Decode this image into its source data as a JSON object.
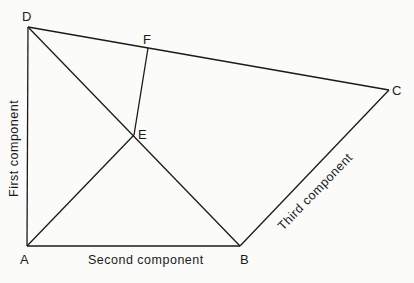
{
  "diagram": {
    "points": {
      "A": {
        "label": "A",
        "x": 27,
        "y": 246
      },
      "B": {
        "label": "B",
        "x": 240,
        "y": 246
      },
      "C": {
        "label": "C",
        "x": 389,
        "y": 90
      },
      "D": {
        "label": "D",
        "x": 28,
        "y": 27
      },
      "E": {
        "label": "E",
        "x": 134,
        "y": 135
      },
      "F": {
        "label": "F",
        "x": 148,
        "y": 48
      }
    },
    "segments": [
      [
        "A",
        "D"
      ],
      [
        "A",
        "B"
      ],
      [
        "B",
        "C"
      ],
      [
        "D",
        "C"
      ],
      [
        "D",
        "B"
      ],
      [
        "A",
        "E"
      ],
      [
        "E",
        "F"
      ]
    ],
    "axis_labels": {
      "first": "First component",
      "second": "Second component",
      "third": "Third component"
    },
    "line_color": "#1a1a1a"
  }
}
